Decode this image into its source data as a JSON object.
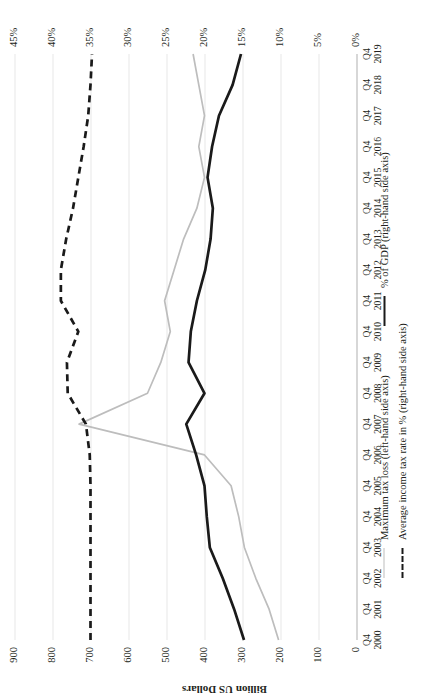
{
  "chart_data": {
    "type": "line",
    "title": "",
    "xlabel": "",
    "ylabel": "Billion US Dollars",
    "y2label": "",
    "ylim": [
      0,
      900
    ],
    "y2lim": [
      0,
      45
    ],
    "grid": true,
    "legend_position": "bottom",
    "categories": [
      "Q4 2000",
      "Q4 2001",
      "Q4 2002",
      "Q4 2003",
      "Q4 2004",
      "Q4 2005",
      "Q4 2006",
      "Q4 2007",
      "Q4 2008",
      "Q4 2009",
      "Q4 2010",
      "Q4 2011",
      "Q4 2012",
      "Q4 2013",
      "Q4 2014",
      "Q4 2015",
      "Q4 2016",
      "Q4 2017",
      "Q4 2018",
      "Q4 2019"
    ],
    "category_top_labels": [
      "Q4",
      "Q4",
      "Q4",
      "Q4",
      "Q4",
      "Q4",
      "Q4",
      "Q4",
      "Q4",
      "Q4",
      "Q4",
      "Q4",
      "Q4",
      "Q4",
      "Q4",
      "Q4",
      "Q4",
      "Q4",
      "Q4",
      "Q4"
    ],
    "category_year_labels": [
      "2000",
      "2001",
      "2002",
      "2003",
      "2004",
      "2005",
      "2006",
      "2007",
      "2008",
      "2009",
      "2010",
      "2011",
      "2012",
      "2013",
      "2014",
      "2015",
      "2016",
      "2017",
      "2018",
      "2019"
    ],
    "y_ticks": [
      0,
      100,
      200,
      300,
      400,
      500,
      600,
      700,
      800,
      900
    ],
    "y_tick_labels": [
      "0",
      "100",
      "200",
      "300",
      "400",
      "500",
      "600",
      "700",
      "800",
      "900"
    ],
    "y2_ticks": [
      0,
      5,
      10,
      15,
      20,
      25,
      30,
      35,
      40,
      45
    ],
    "y2_tick_labels": [
      "0%",
      "5%",
      "10%",
      "15%",
      "20%",
      "25%",
      "30%",
      "35%",
      "40%",
      "45%"
    ],
    "series": [
      {
        "name": "Maximum tax loss (left-hand side axis)",
        "axis": "left",
        "style": "solid",
        "color": "#bdbdbd",
        "values": [
          205,
          230,
          265,
          295,
          310,
          330,
          400,
          730,
          550,
          515,
          490,
          505,
          480,
          455,
          420,
          400,
          415,
          400,
          415,
          430
        ]
      },
      {
        "name": "% of GDP (right-hand side axis)",
        "axis": "right",
        "style": "solid",
        "color": "#1a1a1a",
        "values": [
          14.8,
          16.1,
          17.6,
          19.3,
          19.7,
          20.0,
          21.1,
          22.4,
          20.0,
          22.1,
          21.8,
          21.0,
          19.9,
          19.2,
          18.9,
          19.6,
          19.0,
          18.1,
          16.3,
          15.2
        ]
      },
      {
        "name": "Average income tax rate in % (right-hand side axis)",
        "axis": "right",
        "style": "dashed",
        "color": "#1a1a1a",
        "values": [
          35.0,
          35.0,
          35.0,
          35.0,
          35.0,
          35.0,
          35.1,
          35.6,
          38.0,
          38.1,
          36.6,
          38.9,
          38.9,
          38.2,
          37.3,
          36.6,
          35.9,
          35.3,
          35.0,
          34.8
        ]
      }
    ]
  },
  "legend": {
    "entries": [
      {
        "label": "Maximum tax loss (left-hand side axis)",
        "swatch": "solid-grey"
      },
      {
        "label": "Average income tax rate in % (right-hand side axis)",
        "swatch": "dashed-black"
      },
      {
        "label": "% of GDP (right-hand side axis)",
        "swatch": "solid-black"
      }
    ]
  }
}
